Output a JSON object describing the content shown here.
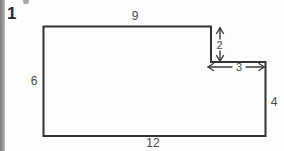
{
  "problem_number": "1",
  "diagram": {
    "shape": "rectangle with rectangular notch cut from top-right corner (L-shaped rectilinear polygon)",
    "dimensions": {
      "top": "9",
      "left": "6",
      "bottom": "12",
      "right": "4",
      "notch_depth": "2",
      "notch_width": "3"
    },
    "colors": {
      "outline": "#333333",
      "arrow": "#3a3a3a",
      "label_text": "#4a4a4a",
      "problem_number_text": "#2a2a2a",
      "page_edge": "#8f8f8f",
      "background": "#fdfdfd"
    }
  }
}
